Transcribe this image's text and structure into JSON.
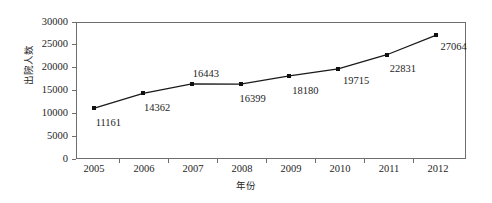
{
  "chart_data": {
    "type": "line",
    "title": "",
    "subtitle": "",
    "xlabel": "年份",
    "ylabel": "出院人数",
    "categories": [
      "2005",
      "2006",
      "2007",
      "2008",
      "2009",
      "2010",
      "2011",
      "2012"
    ],
    "values": [
      11161,
      14362,
      16443,
      16399,
      18180,
      19715,
      22831,
      27064
    ],
    "series": [
      {
        "name": "出院人数",
        "values": [
          11161,
          14362,
          16443,
          16399,
          18180,
          19715,
          22831,
          27064
        ]
      }
    ],
    "data_labels": [
      "11161",
      "14362",
      "16443",
      "16399",
      "18180",
      "19715",
      "22831",
      "27064"
    ],
    "ylim": [
      0,
      30000
    ],
    "y_ticks": [
      0,
      5000,
      10000,
      15000,
      20000,
      25000,
      30000
    ],
    "y_tick_labels": [
      "0",
      "5000",
      "10000",
      "15000",
      "20000",
      "25000",
      "30000"
    ],
    "x_tick_labels": [
      "2005",
      "2006",
      "2007",
      "2008",
      "2009",
      "2010",
      "2011",
      "2012"
    ],
    "grid": false,
    "legend": false,
    "legend_position": "none",
    "marker": "square",
    "line_color": "#1a1a1a",
    "marker_color": "#111111",
    "axis_color": "#6e6e6e",
    "background_color": "#ffffff"
  }
}
